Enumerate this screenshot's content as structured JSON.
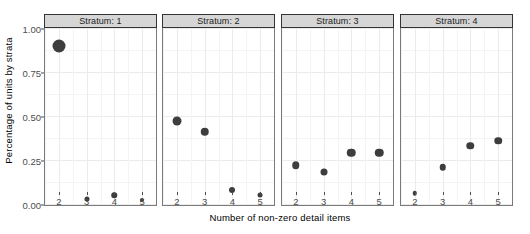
{
  "chart_data": {
    "type": "scatter",
    "title": "",
    "xlabel": "Number of non-zero detail items",
    "ylabel": "Percentage of units by strata",
    "x": [
      2,
      3,
      4,
      5
    ],
    "xlim": [
      1.5,
      5.5
    ],
    "ylim": [
      0.0,
      1.0
    ],
    "xticks": [
      "2",
      "3",
      "4",
      "5"
    ],
    "yticks": [
      "0.00",
      "0.25",
      "0.50",
      "0.75",
      "1.00"
    ],
    "ytick_values": [
      0.0,
      0.25,
      0.5,
      0.75,
      1.0
    ],
    "grid": true,
    "legend": "none",
    "facet_variable": "Stratum",
    "size_encodes": "count",
    "point_color": "#3d3d3d",
    "panels": [
      {
        "strip_label": "Stratum: 1",
        "points": [
          {
            "x": 2,
            "y": 0.9,
            "size": 13
          },
          {
            "x": 3,
            "y": 0.03,
            "size": 5
          },
          {
            "x": 4,
            "y": 0.05,
            "size": 5.5
          },
          {
            "x": 5,
            "y": 0.02,
            "size": 4
          }
        ]
      },
      {
        "strip_label": "Stratum: 2",
        "points": [
          {
            "x": 2,
            "y": 0.47,
            "size": 9
          },
          {
            "x": 3,
            "y": 0.41,
            "size": 8.5
          },
          {
            "x": 4,
            "y": 0.08,
            "size": 6
          },
          {
            "x": 5,
            "y": 0.05,
            "size": 5
          }
        ]
      },
      {
        "strip_label": "Stratum: 3",
        "points": [
          {
            "x": 2,
            "y": 0.22,
            "size": 7.5
          },
          {
            "x": 3,
            "y": 0.18,
            "size": 7
          },
          {
            "x": 4,
            "y": 0.29,
            "size": 8.5
          },
          {
            "x": 5,
            "y": 0.29,
            "size": 8.5
          }
        ]
      },
      {
        "strip_label": "Stratum: 4",
        "points": [
          {
            "x": 2,
            "y": 0.06,
            "size": 4.5
          },
          {
            "x": 3,
            "y": 0.21,
            "size": 6.5
          },
          {
            "x": 4,
            "y": 0.33,
            "size": 7.5
          },
          {
            "x": 5,
            "y": 0.36,
            "size": 7.5
          }
        ]
      }
    ]
  }
}
